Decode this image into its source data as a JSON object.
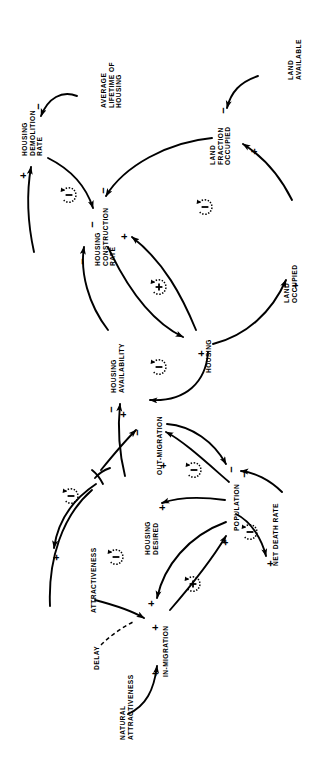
{
  "diagram": {
    "type": "causal-loop-diagram",
    "orientation": "rotated-90-ccw",
    "stroke_color": "#000000",
    "background_color": "#ffffff"
  },
  "nodes": [
    {
      "id": "avg-lifetime-of-housing",
      "label": "AVERAGE\nLIFETIME OF\nHOUSING"
    },
    {
      "id": "housing-demolition-rate",
      "label": "HOUSING\nDEMOLITION\nRATE"
    },
    {
      "id": "land-available",
      "label": "LAND\nAVAILABLE"
    },
    {
      "id": "land-fraction-occupied",
      "label": "LAND\nFRACTION\nOCCUPIED"
    },
    {
      "id": "housing-construction-rate",
      "label": "HOUSING\nCONSTRUCTION\nRATE"
    },
    {
      "id": "land-occupied",
      "label": "LAND\nOCCUPIED"
    },
    {
      "id": "housing",
      "label": "HOUSING"
    },
    {
      "id": "housing-availability",
      "label": "HOUSING\nAVAILABILITY"
    },
    {
      "id": "out-migration",
      "label": "OUT-MIGRATION"
    },
    {
      "id": "housing-desired",
      "label": "HOUSING\nDESIRED"
    },
    {
      "id": "population",
      "label": "POPULATION"
    },
    {
      "id": "net-death-rate",
      "label": "NET DEATH RATE"
    },
    {
      "id": "attractiveness",
      "label": "ATTRACTIVENESS"
    },
    {
      "id": "in-migration",
      "label": "IN-MIGRATION"
    },
    {
      "id": "natural-attractiveness",
      "label": "NATURAL\nATTRACTIVENESS"
    },
    {
      "id": "delay",
      "label": "DELAY"
    }
  ],
  "links": [
    {
      "id": "lifetime-to-demolition",
      "from": "avg-lifetime-of-housing",
      "to": "housing-demolition-rate",
      "polarity": "-"
    },
    {
      "id": "housing-to-demolition",
      "from": "housing",
      "to": "housing-demolition-rate",
      "polarity": "+"
    },
    {
      "id": "demolition-to-housing",
      "from": "housing-demolition-rate",
      "to": "housing",
      "polarity": "-"
    },
    {
      "id": "available-to-fraction",
      "from": "land-available",
      "to": "land-fraction-occupied",
      "polarity": "-"
    },
    {
      "id": "occupied-to-fraction",
      "from": "land-occupied",
      "to": "land-fraction-occupied",
      "polarity": "+"
    },
    {
      "id": "fraction-to-construction",
      "from": "land-fraction-occupied",
      "to": "housing-construction-rate",
      "polarity": "-"
    },
    {
      "id": "housing-to-construction",
      "from": "housing",
      "to": "housing-construction-rate",
      "polarity": "+"
    },
    {
      "id": "availability-to-construction",
      "from": "housing-availability",
      "to": "housing-construction-rate",
      "polarity": "-"
    },
    {
      "id": "construction-to-housing",
      "from": "housing-construction-rate",
      "to": "housing",
      "polarity": "+"
    },
    {
      "id": "housing-to-land-occupied",
      "from": "housing",
      "to": "land-occupied",
      "polarity": "+"
    },
    {
      "id": "housing-to-availability",
      "from": "housing",
      "to": "housing-availability",
      "polarity": "+"
    },
    {
      "id": "desired-to-availability",
      "from": "housing-desired",
      "to": "housing-availability",
      "polarity": "-"
    },
    {
      "id": "availability-to-outmigration",
      "from": "housing-availability",
      "to": "out-migration",
      "polarity": "-"
    },
    {
      "id": "population-to-outmigration",
      "from": "population",
      "to": "out-migration",
      "polarity": "+"
    },
    {
      "id": "outmigration-to-population",
      "from": "out-migration",
      "to": "population",
      "polarity": "-"
    },
    {
      "id": "population-to-desired",
      "from": "population",
      "to": "housing-desired",
      "polarity": "+"
    },
    {
      "id": "population-to-deathrate",
      "from": "population",
      "to": "net-death-rate",
      "polarity": "+"
    },
    {
      "id": "deathrate-to-population",
      "from": "net-death-rate",
      "to": "population",
      "polarity": "-"
    },
    {
      "id": "availability-to-attractiveness",
      "from": "housing-availability",
      "to": "attractiveness",
      "polarity": "+"
    },
    {
      "id": "attractiveness-to-inmigration",
      "from": "attractiveness",
      "to": "in-migration",
      "polarity": "+"
    },
    {
      "id": "natural-to-inmigration",
      "from": "natural-attractiveness",
      "to": "in-migration",
      "polarity": "+"
    },
    {
      "id": "population-to-inmigration",
      "from": "population",
      "to": "in-migration",
      "polarity": "+"
    },
    {
      "id": "inmigration-to-population",
      "from": "in-migration",
      "to": "population",
      "polarity": "+"
    }
  ],
  "loop_markers": [
    {
      "id": "loop-demolition-housing",
      "polarity": "-"
    },
    {
      "id": "loop-land-fraction",
      "polarity": "-"
    },
    {
      "id": "loop-construction-housing",
      "polarity": "+"
    },
    {
      "id": "loop-housing-availability",
      "polarity": "-"
    },
    {
      "id": "loop-outmigration-population",
      "polarity": "-"
    },
    {
      "id": "loop-population-deathrate",
      "polarity": "-"
    },
    {
      "id": "loop-attractiveness",
      "polarity": "-"
    },
    {
      "id": "loop-inmigration-population",
      "polarity": "+"
    }
  ],
  "signs": {
    "plus": "+",
    "minus": "−",
    "loop_plus": "(+)",
    "loop_minus": "(−)"
  }
}
